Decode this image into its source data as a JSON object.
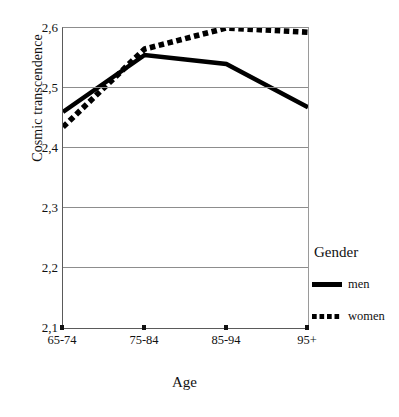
{
  "chart_data": {
    "type": "line",
    "title": "",
    "xlabel": "Age",
    "ylabel": "Cosmic transcendence",
    "categories": [
      "65-74",
      "75-84",
      "85-94",
      "95+"
    ],
    "ylim": [
      2.1,
      2.6
    ],
    "yticks": [
      "2,6",
      "2,5",
      "2,4",
      "2,3",
      "2,2",
      "2,1"
    ],
    "ytick_values": [
      2.6,
      2.5,
      2.4,
      2.3,
      2.2,
      2.1
    ],
    "grid": true,
    "legend_position": "right",
    "legend_title": "Gender",
    "series": [
      {
        "name": "men",
        "style": "solid",
        "color": "#000000",
        "values": [
          2.46,
          2.555,
          2.54,
          2.468
        ]
      },
      {
        "name": "women",
        "style": "dotted",
        "color": "#000000",
        "values": [
          2.435,
          2.565,
          2.6,
          2.593
        ]
      }
    ]
  },
  "axes": {
    "x_title": "Age",
    "y_title": "Cosmic transcendence"
  },
  "legend": {
    "title": "Gender",
    "entries": [
      {
        "label": "men",
        "style": "solid"
      },
      {
        "label": "women",
        "style": "dotted"
      }
    ]
  },
  "caption": {
    "cropped_text": ""
  }
}
